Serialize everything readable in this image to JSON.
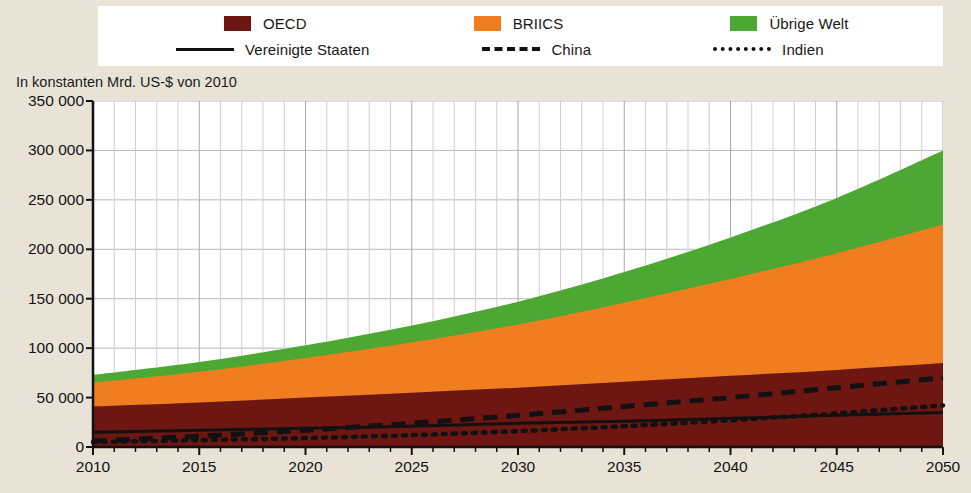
{
  "legend": {
    "rows": [
      [
        {
          "type": "swatch",
          "color": "#6E1612",
          "label": "OECD",
          "name": "legend-oecd"
        },
        {
          "type": "swatch",
          "color": "#F07E20",
          "label": "BRIICS",
          "name": "legend-briics"
        },
        {
          "type": "swatch",
          "color": "#4CA832",
          "label": "Übrige Welt",
          "name": "legend-uebrige-welt"
        }
      ],
      [
        {
          "type": "line",
          "style": "solid",
          "label": "Vereinigte Staaten",
          "name": "legend-vereinigte-staaten"
        },
        {
          "type": "line",
          "style": "dashed",
          "label": "China",
          "name": "legend-china"
        },
        {
          "type": "line",
          "style": "dotted",
          "label": "Indien",
          "name": "legend-indien"
        }
      ]
    ]
  },
  "axis_caption": "In konstanten Mrd. US-$ von 2010",
  "chart_data": {
    "type": "area",
    "title": "",
    "subtitle": "",
    "xlabel": "",
    "ylabel": "In konstanten Mrd. US-$ von 2010",
    "xlim": [
      2010,
      2050
    ],
    "ylim": [
      0,
      350000
    ],
    "ytick_labels": [
      "350 000",
      "300 000",
      "250 000",
      "200 000",
      "150 000",
      "100 000",
      "50 000",
      "0"
    ],
    "ytick_values": [
      350000,
      300000,
      250000,
      200000,
      150000,
      100000,
      50000,
      0
    ],
    "xtick_labels": [
      "2010",
      "2015",
      "2020",
      "2025",
      "2030",
      "2035",
      "2040",
      "2045",
      "2050"
    ],
    "xtick_values": [
      2010,
      2015,
      2020,
      2025,
      2030,
      2035,
      2040,
      2045,
      2050
    ],
    "grid": true,
    "legend_position": "top",
    "stacked": true,
    "x": [
      2010,
      2015,
      2020,
      2025,
      2030,
      2035,
      2040,
      2045,
      2050
    ],
    "series": [
      {
        "name": "OECD",
        "kind": "area",
        "color": "#6E1612",
        "values": [
          41000,
          45000,
          50000,
          55000,
          60000,
          66000,
          72000,
          78000,
          85000
        ]
      },
      {
        "name": "BRIICS",
        "kind": "area",
        "color": "#F07E20",
        "values": [
          24000,
          31000,
          40000,
          51000,
          64000,
          80000,
          98000,
          118000,
          140000
        ]
      },
      {
        "name": "Übrige Welt",
        "kind": "area",
        "color": "#4CA832",
        "values": [
          8000,
          10000,
          13000,
          17000,
          23000,
          31000,
          42000,
          56000,
          75000
        ]
      }
    ],
    "stack_tops": [
      {
        "name": "OECD",
        "values": [
          41000,
          45000,
          50000,
          55000,
          60000,
          66000,
          72000,
          78000,
          85000
        ]
      },
      {
        "name": "OECD+BRIICS",
        "values": [
          65000,
          76000,
          90000,
          106000,
          124000,
          146000,
          170000,
          196000,
          225000
        ]
      },
      {
        "name": "Total",
        "values": [
          73000,
          86000,
          103000,
          123000,
          147000,
          177000,
          212000,
          252000,
          300000
        ]
      }
    ],
    "lines": [
      {
        "name": "Vereinigte Staaten",
        "style": "solid",
        "color": "#111111",
        "values": [
          15000,
          17000,
          19000,
          21000,
          24000,
          26000,
          29000,
          32000,
          35000
        ]
      },
      {
        "name": "China",
        "style": "dashed",
        "color": "#111111",
        "values": [
          6000,
          11000,
          17000,
          24000,
          32000,
          41000,
          50000,
          60000,
          70000
        ]
      },
      {
        "name": "Indien",
        "style": "dotted",
        "color": "#111111",
        "values": [
          5000,
          7000,
          9000,
          12000,
          16000,
          21000,
          27000,
          34000,
          42000
        ]
      }
    ]
  }
}
